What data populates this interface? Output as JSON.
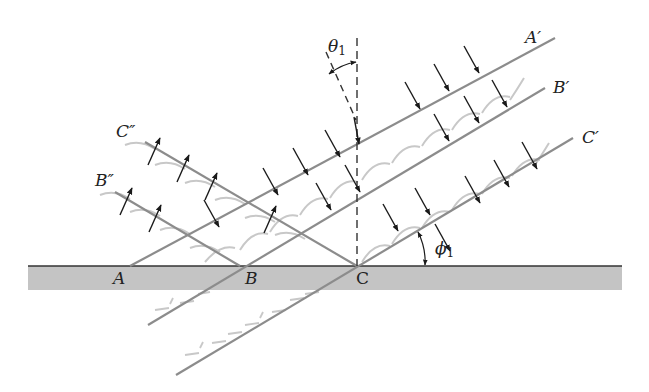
{
  "figure": {
    "labels": {
      "A": "A",
      "B": "B",
      "C": "C",
      "A_prime": "A′",
      "B_prime": "B′",
      "C_prime": "C′",
      "B_double_prime": "B″",
      "C_double_prime": "C″",
      "theta": "θ",
      "theta_sub": "1",
      "phi": "ϕ",
      "phi_sub": "1"
    },
    "colors": {
      "surface_fill": "#c4c4c4",
      "surface_line": "#333333",
      "ray_line": "#8c8c8c",
      "wavelet": "#c8c8c8",
      "arrow": "#1a1a1a",
      "dashed": "#333333"
    }
  }
}
